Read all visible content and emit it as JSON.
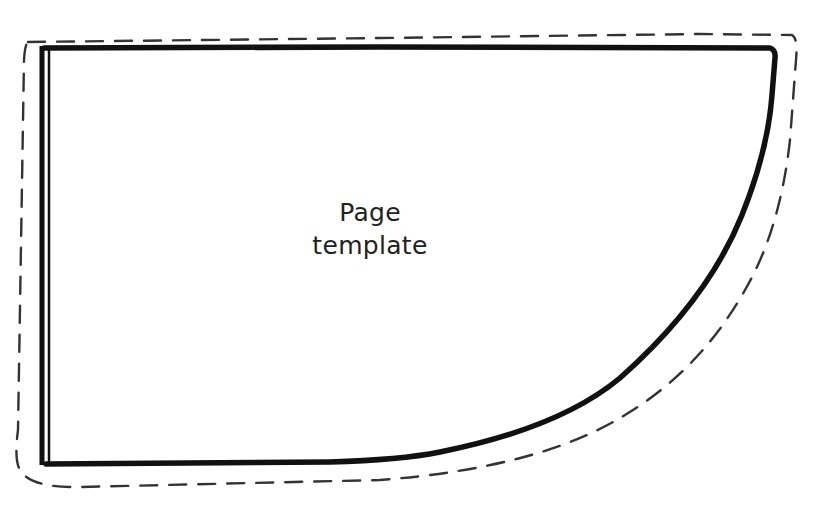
{
  "diagram": {
    "type": "sewing-pattern-piece",
    "piece_label": {
      "line1": "Page",
      "line2": "template"
    },
    "outlines": {
      "cut_line": {
        "style": "dashed",
        "color": "#333333",
        "meaning": "seam allowance / cutting line"
      },
      "stitch_line": {
        "style": "solid-thick",
        "color": "#111111",
        "meaning": "finished edge"
      },
      "fold_edge": {
        "style": "double-line",
        "side": "left",
        "color": "#111111"
      }
    },
    "colors": {
      "background": "#ffffff",
      "ink": "#111111"
    }
  }
}
